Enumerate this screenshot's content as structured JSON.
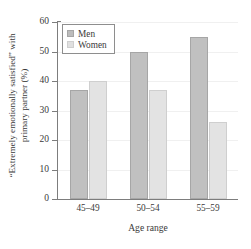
{
  "chart_data": {
    "type": "bar",
    "title": "",
    "xlabel": "Age range",
    "ylabel_line1": "“Extremely emotionally satisfied” with",
    "ylabel_line2": "primary partner (%)",
    "categories": [
      "45–49",
      "50–54",
      "55–59"
    ],
    "series": [
      {
        "name": "Men",
        "values": [
          37,
          50,
          55
        ],
        "color": "#c0c0c0"
      },
      {
        "name": "Women",
        "values": [
          40,
          37,
          26
        ],
        "color": "#e3e3e3"
      }
    ],
    "ylim": [
      0,
      60
    ],
    "yticks": [
      0,
      10,
      20,
      30,
      40,
      50,
      60
    ],
    "ytick_labels": [
      "0",
      "10",
      "20",
      "30",
      "40",
      "50",
      "60"
    ],
    "grid": "horizontal-faint",
    "legend_position": "upper-left-inside",
    "legend_entries": [
      "Men",
      "Women"
    ]
  }
}
